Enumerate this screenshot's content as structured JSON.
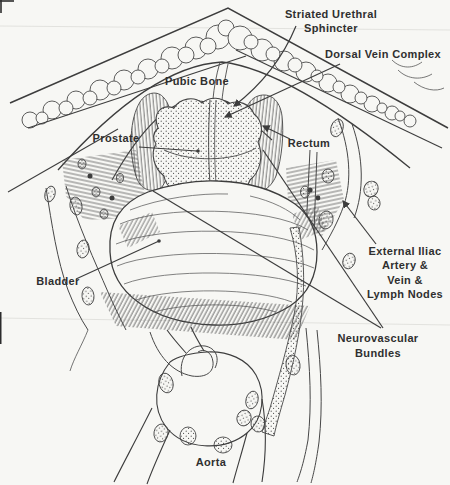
{
  "illustration": {
    "labels": {
      "striated_urethral_sphincter": {
        "line1": "Striated Urethral",
        "line2": "Sphincter"
      },
      "dorsal_vein_complex": {
        "text": "Dorsal Vein Complex"
      },
      "pubic_bone": {
        "text": "Pubic Bone"
      },
      "prostate": {
        "text": "Prostate"
      },
      "rectum": {
        "text": "Rectum"
      },
      "external_iliac": {
        "line1": "External Iliac",
        "line2": "Artery &",
        "line3": "Vein &",
        "line4": "Lymph Nodes"
      },
      "bladder": {
        "text": "Bladder"
      },
      "neurovascular_bundles": {
        "line1": "Neurovascular",
        "line2": "Bundles"
      },
      "aorta": {
        "text": "Aorta"
      }
    },
    "colors": {
      "background": "#f7f7f4",
      "ink": "#3d3d3d",
      "label_text": "#2f2f2f",
      "scan_line": "#e2e2de"
    }
  }
}
